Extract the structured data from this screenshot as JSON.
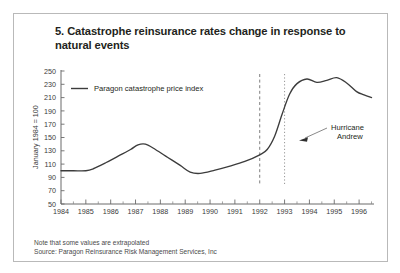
{
  "figure": {
    "title": "5. Catastrophe reinsurance rates change in response to natural events",
    "border_color": "#b9b9b9",
    "background": "#ffffff"
  },
  "footnotes": {
    "note": "Note that some values are extrapolated",
    "source": "Source: Paragon Reinsurance Risk Management Services, Inc"
  },
  "chart_data": {
    "type": "line",
    "title": "5. Catastrophe reinsurance rates change in response to natural events",
    "xlabel": "",
    "ylabel": "January 1984 = 100",
    "ylim": [
      50,
      250
    ],
    "xlim": [
      1984,
      1996.6
    ],
    "ytick_step": 20,
    "grid": false,
    "legend_position": "top-left",
    "line_color": "#3c3c3c",
    "yticks": [
      250,
      230,
      210,
      190,
      170,
      150,
      130,
      110,
      90,
      70,
      50
    ],
    "xticks": [
      1984,
      1985,
      1986,
      1987,
      1988,
      1989,
      1990,
      1991,
      1992,
      1993,
      1994,
      1995,
      1996
    ],
    "xminor_per_year": 2,
    "series": [
      {
        "name": "Paragon catastrophe price index",
        "x": [
          1984.0,
          1984.5,
          1985.0,
          1985.3,
          1985.8,
          1986.3,
          1986.8,
          1987.1,
          1987.4,
          1987.8,
          1988.3,
          1988.8,
          1989.2,
          1989.6,
          1990.2,
          1990.8,
          1991.4,
          1992.0,
          1992.3,
          1992.6,
          1992.9,
          1993.2,
          1993.5,
          1993.9,
          1994.3,
          1994.7,
          1995.1,
          1995.5,
          1995.9,
          1996.2,
          1996.5
        ],
        "y": [
          100,
          100,
          100,
          103,
          112,
          122,
          132,
          139,
          140,
          132,
          120,
          108,
          98,
          96,
          101,
          107,
          114,
          124,
          132,
          152,
          185,
          215,
          231,
          238,
          233,
          236,
          240,
          232,
          219,
          214,
          210
        ]
      }
    ],
    "reference_lines": [
      {
        "name": "dashed-marker-1992",
        "x": 1992.0,
        "style": "dashed",
        "color": "#6e6e6e"
      },
      {
        "name": "dotted-marker-1993",
        "x": 1993.0,
        "style": "dotted",
        "color": "#8a8a8a"
      }
    ],
    "annotations": [
      {
        "name": "hurricane-andrew",
        "text_line1": "Hurricane",
        "text_line2": "Andrew",
        "target_x": 1993.0,
        "target_y": 152,
        "arrow": true
      }
    ]
  },
  "legend": {
    "items": [
      {
        "label": "Paragon catastrophe price index",
        "color": "#3c3c3c"
      }
    ]
  }
}
